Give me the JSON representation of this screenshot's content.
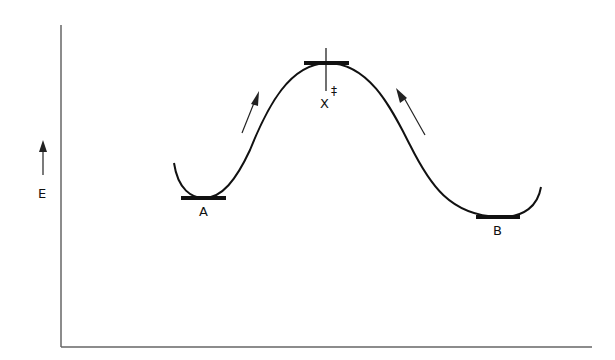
{
  "diagram": {
    "type": "energy-profile",
    "axis": {
      "y_label": "E",
      "y_arrow": "up-arrow-icon"
    },
    "labels": {
      "reactant": "A",
      "product": "B",
      "transition_state": "X",
      "transition_superscript": "‡"
    },
    "colors": {
      "stroke": "#111111",
      "axis": "#555555",
      "background": "#ffffff"
    }
  }
}
